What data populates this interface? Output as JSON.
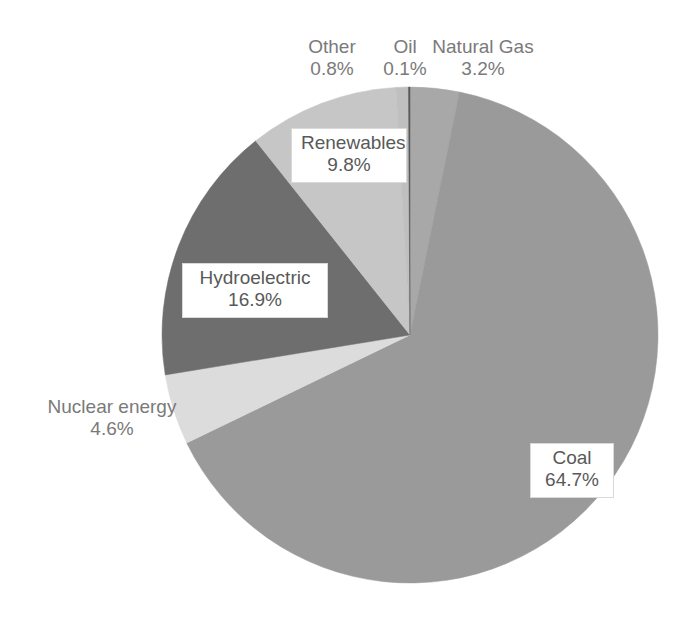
{
  "chart_data": {
    "type": "pie",
    "title": "",
    "subtitle": "",
    "xlabel": "",
    "ylabel": "",
    "units": "percent",
    "legend": "none",
    "grid": false,
    "start_angle_deg": 0,
    "direction": "clockwise",
    "categories": [
      "Natural Gas",
      "Coal",
      "Nuclear energy",
      "Hydroelectric",
      "Renewables",
      "Other",
      "Oil"
    ],
    "values": [
      3.2,
      64.7,
      4.6,
      16.9,
      9.8,
      0.8,
      0.1
    ],
    "labels": [
      "3.2%",
      "64.7%",
      "4.6%",
      "16.9%",
      "9.8%",
      "0.8%",
      "0.1%"
    ],
    "colors": [
      "#A8A8A8",
      "#9A9A9A",
      "#DCDCDC",
      "#6E6E6E",
      "#C6C6C6",
      "#BFBFBF",
      "#5A5A5A"
    ],
    "slices": [
      {
        "name": "Natural Gas",
        "value": 3.2,
        "label": "3.2%",
        "color": "#A8A8A8",
        "label_style": "outside-plain"
      },
      {
        "name": "Coal",
        "value": 64.7,
        "label": "64.7%",
        "color": "#9A9A9A",
        "label_style": "inside-box"
      },
      {
        "name": "Nuclear energy",
        "value": 4.6,
        "label": "4.6%",
        "color": "#DCDCDC",
        "label_style": "outside-plain"
      },
      {
        "name": "Hydroelectric",
        "value": 16.9,
        "label": "16.9%",
        "color": "#6E6E6E",
        "label_style": "inside-box"
      },
      {
        "name": "Renewables",
        "value": 9.8,
        "label": "9.8%",
        "color": "#C6C6C6",
        "label_style": "inside-box"
      },
      {
        "name": "Other",
        "value": 0.8,
        "label": "0.8%",
        "color": "#BFBFBF",
        "label_style": "outside-plain"
      },
      {
        "name": "Oil",
        "value": 0.1,
        "label": "0.1%",
        "color": "#5A5A5A",
        "label_style": "outside-plain"
      }
    ]
  },
  "labels": {
    "other": {
      "name": "Other",
      "value": "0.8%"
    },
    "oil": {
      "name": "Oil",
      "value": "0.1%"
    },
    "natural_gas": {
      "name": "Natural Gas",
      "value": "3.2%"
    },
    "renewables": {
      "name": "Renewables",
      "value": "9.8%"
    },
    "hydro": {
      "name": "Hydroelectric",
      "value": "16.9%"
    },
    "nuclear": {
      "name": "Nuclear energy",
      "value": "4.6%"
    },
    "coal": {
      "name": "Coal",
      "value": "64.7%"
    }
  },
  "colors": {
    "background": "#FFFFFF",
    "text": "#595959",
    "callout_border": "#D9D9D9"
  }
}
